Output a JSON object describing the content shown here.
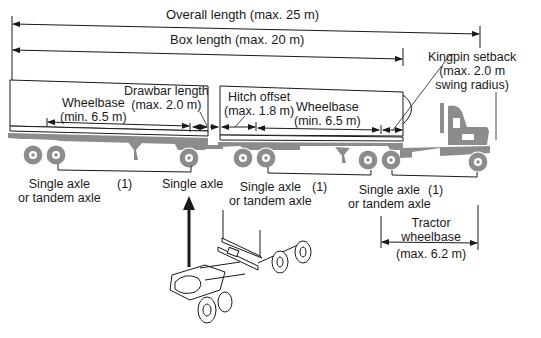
{
  "diagram": {
    "colors": {
      "line": "#1a1a1a",
      "vehicle_fill": "#8c8c8c",
      "box_fill": "#ffffff",
      "background": "#ffffff"
    },
    "dimensions": {
      "overall_length": {
        "label": "Overall length (max. 25 m)"
      },
      "box_length": {
        "label": "Box length (max. 20 m)"
      },
      "kingpin_setback": {
        "line1": "Kingpin setback",
        "line2": "(max. 2.0 m",
        "line3": "swing radius)"
      },
      "drawbar_length": {
        "line1": "Drawbar length",
        "line2": "(max. 2.0 m)"
      },
      "hitch_offset": {
        "line1": "Hitch offset",
        "line2": "(max. 1.8 m)"
      },
      "rear_wheelbase": {
        "line1": "Wheelbase",
        "line2": "(min. 6.5 m)"
      },
      "front_wheelbase": {
        "line1": "Wheelbase",
        "line2": "(min. 6.5 m)"
      },
      "tractor_wheelbase": {
        "line1": "Tractor",
        "line2": "wheelbase",
        "line3": "(max. 6.2 m)"
      }
    },
    "axle_labels": {
      "rear_trailer_rear": {
        "line1": "Single axle",
        "line2": "or tandem axle"
      },
      "rear_trailer_note": "(1)",
      "dolly_axle": "Single axle",
      "front_trailer_rear": {
        "line1": "Single axle",
        "line2": "or tandem axle"
      },
      "front_trailer_note": "(1)",
      "tractor_drive": {
        "line1": "Single axle",
        "line2": "or tandem axle"
      },
      "tractor_note": "(1)"
    }
  }
}
